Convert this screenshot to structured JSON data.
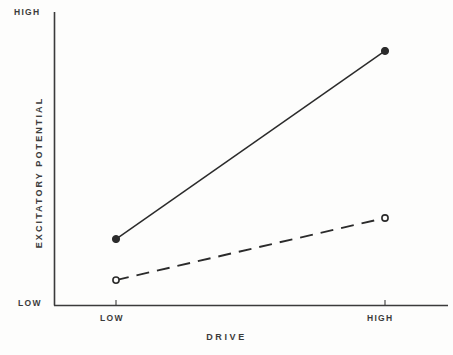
{
  "chart_data": {
    "type": "line",
    "title": "",
    "xlabel": "DRIVE",
    "ylabel": "EXCITATORY  POTENTIAL",
    "categories": [
      "LOW",
      "HIGH"
    ],
    "x": [
      0,
      1
    ],
    "xlim": [
      -0.23,
      1.23
    ],
    "ylim": [
      0,
      1
    ],
    "ytick_labels": [
      "LOW",
      "HIGH"
    ],
    "ytick_values": [
      0,
      1
    ],
    "xtick_labels": [
      "LOW",
      "HIGH"
    ],
    "grid": false,
    "legend": "none",
    "series": [
      {
        "name": "solid-filled",
        "values": [
          0.225,
          0.867
        ],
        "linestyle": "solid",
        "marker": "filled-circle",
        "color": "#2b2b2b"
      },
      {
        "name": "dashed-open",
        "values": [
          0.085,
          0.297
        ],
        "linestyle": "dashed",
        "marker": "open-circle",
        "color": "#2b2b2b"
      }
    ]
  },
  "axes": {
    "y_top_label": "HIGH",
    "y_bottom_label": "LOW",
    "y_title": "EXCITATORY  POTENTIAL",
    "x_left_label": "LOW",
    "x_right_label": "HIGH",
    "x_title": "DRIVE"
  },
  "style": {
    "axis_color": "#3b3b3b",
    "line_color": "#2b2b2b",
    "background": "#fdfdfc",
    "text_color": "#3b3b3b"
  }
}
